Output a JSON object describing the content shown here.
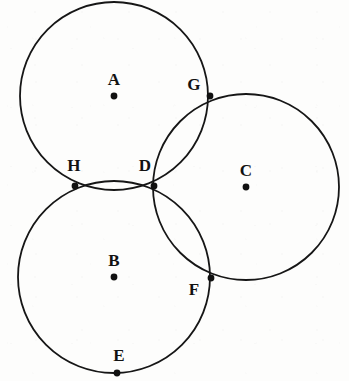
{
  "figure": {
    "width": 349,
    "height": 381,
    "background_color": "#fdfdfc",
    "stroke_color": "#161616",
    "stroke_width": 1.8,
    "point_color": "#111111",
    "point_radius": 3.4,
    "label_color": "#121212"
  },
  "circles": [
    {
      "id": "circle-a",
      "center_label": "A",
      "cx": 114,
      "cy": 96,
      "r": 94
    },
    {
      "id": "circle-b",
      "center_label": "B",
      "cx": 114,
      "cy": 277,
      "r": 96
    },
    {
      "id": "circle-c",
      "center_label": "C",
      "cx": 246,
      "cy": 187,
      "r": 93
    }
  ],
  "points": [
    {
      "id": "point-a",
      "label": "A",
      "kind": "center",
      "x": 114,
      "y": 96,
      "label_x": 114,
      "label_y": 79
    },
    {
      "id": "point-b",
      "label": "B",
      "kind": "center",
      "x": 114,
      "y": 277,
      "label_x": 114,
      "label_y": 260
    },
    {
      "id": "point-c",
      "label": "C",
      "kind": "center",
      "x": 246,
      "y": 187,
      "label_x": 246,
      "label_y": 170
    },
    {
      "id": "point-d",
      "label": "D",
      "kind": "intersection",
      "x": 154,
      "y": 186,
      "label_x": 145,
      "label_y": 165
    },
    {
      "id": "point-e",
      "label": "E",
      "kind": "on-circle",
      "x": 117,
      "y": 373,
      "label_x": 119,
      "label_y": 355
    },
    {
      "id": "point-f",
      "label": "F",
      "kind": "intersection",
      "x": 211,
      "y": 278,
      "label_x": 194,
      "label_y": 289
    },
    {
      "id": "point-g",
      "label": "G",
      "kind": "intersection",
      "x": 210,
      "y": 96,
      "label_x": 194,
      "label_y": 84
    },
    {
      "id": "point-h",
      "label": "H",
      "kind": "intersection",
      "x": 75,
      "y": 186,
      "label_x": 74,
      "label_y": 165
    }
  ],
  "chart_data": {
    "type": "scatter",
    "xlabel": "",
    "ylabel": "",
    "xlim": [
      0,
      349
    ],
    "ylim": [
      0,
      381
    ],
    "grid": false,
    "legend": "none",
    "circles": [
      {
        "name": "A",
        "cx": 114,
        "cy": 96,
        "r": 94
      },
      {
        "name": "B",
        "cx": 114,
        "cy": 277,
        "r": 96
      },
      {
        "name": "C",
        "cx": 246,
        "cy": 187,
        "r": 93
      }
    ],
    "labels": [
      "A",
      "B",
      "C",
      "D",
      "E",
      "F",
      "G",
      "H"
    ],
    "x": [
      114,
      114,
      246,
      154,
      117,
      211,
      210,
      75
    ],
    "y": [
      96,
      277,
      187,
      186,
      373,
      278,
      96,
      186
    ],
    "annotations": [
      "A = center of upper-left circle",
      "B = center of lower-left circle",
      "C = center of right circle",
      "D = intersection of circles A, B and C",
      "E = point on circle B (bottom)",
      "F = intersection of circles B and C",
      "G = intersection of circles A and C",
      "H = intersection of circles A and B"
    ]
  }
}
